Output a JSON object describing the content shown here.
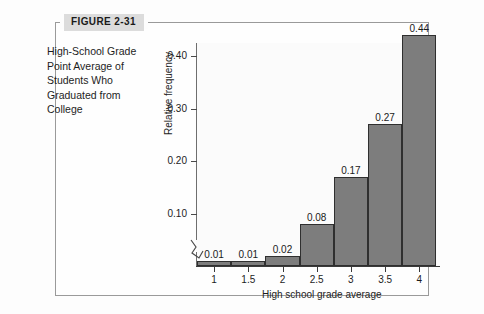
{
  "figure": {
    "tag": "FIGURE 2-31",
    "caption": "High-School Grade Point Average of Students Who Graduated from College"
  },
  "colors": {
    "bar_fill": "#7d7d7d",
    "bar_stroke": "#2f2f2f",
    "axis": "#3a3a3a",
    "tag_background": "#dcdcdc",
    "figure_border": "#9a9a9a",
    "plot_background": "#fbfbfb"
  },
  "chart_data": {
    "type": "bar",
    "title": "",
    "subtitle": "",
    "xlabel": "High school grade average",
    "ylabel": "Relative frequency",
    "categories": [
      "1",
      "1.5",
      "2",
      "2.5",
      "3",
      "3.5",
      "4"
    ],
    "values": [
      0.01,
      0.01,
      0.02,
      0.08,
      0.17,
      0.27,
      0.44
    ],
    "data_labels": [
      "0.01",
      "0.01",
      "0.02",
      "0.08",
      "0.17",
      "0.27",
      "0.44"
    ],
    "ylim": [
      0,
      0.47
    ],
    "ytick_values": [
      0.1,
      0.2,
      0.3,
      0.4
    ],
    "ytick_labels": [
      "0.10",
      "0.20",
      "0.30",
      "0.40"
    ],
    "grid": false,
    "legend": "none",
    "annotations": [
      "y-axis break near origin"
    ],
    "bar_style": "contiguous histogram bars, gray fill with dark outline"
  }
}
